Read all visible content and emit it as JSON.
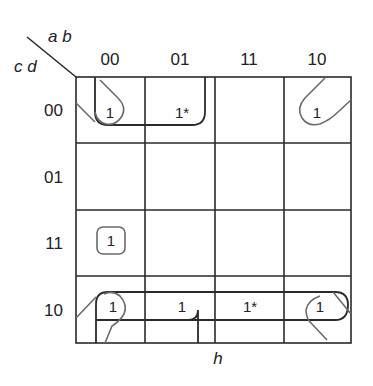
{
  "kmap": {
    "corner": {
      "col_vars": "a b",
      "row_vars": "c d"
    },
    "col_headers": [
      "00",
      "01",
      "11",
      "10"
    ],
    "row_headers": [
      "00",
      "01",
      "11",
      "10"
    ],
    "cells": [
      [
        "1",
        "1*",
        "",
        "1"
      ],
      [
        "",
        "",
        "",
        ""
      ],
      [
        "1",
        "",
        "",
        ""
      ],
      [
        "1",
        "1",
        "1*",
        "1"
      ]
    ],
    "caption": "h",
    "colors": {
      "line": "#2a2a2a",
      "loop_light": "#6a6a6a",
      "background": "#ffffff"
    }
  }
}
